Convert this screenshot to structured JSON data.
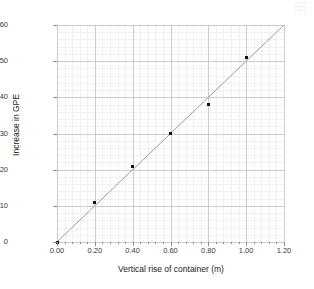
{
  "chart_data": {
    "type": "scatter",
    "title": "",
    "xlabel": "Vertical rise of container (m)",
    "ylabel": "Increase in GPE",
    "xlim": [
      0.0,
      1.2
    ],
    "ylim": [
      0,
      60
    ],
    "grid": true,
    "legend": "none",
    "x_ticks": [
      "0.00",
      "0.20",
      "0.40",
      "0.60",
      "0.80",
      "1.00",
      "1.20"
    ],
    "x_tick_values": [
      0.0,
      0.2,
      0.4,
      0.6,
      0.8,
      1.0,
      1.2
    ],
    "y_ticks": [
      "0",
      "10",
      "20",
      "30",
      "40",
      "50",
      "60"
    ],
    "y_tick_values": [
      0,
      10,
      20,
      30,
      40,
      50,
      60
    ],
    "x": [
      0.0,
      0.2,
      0.4,
      0.6,
      0.8,
      1.0
    ],
    "y": [
      0,
      11,
      21,
      30,
      38,
      51
    ],
    "points": [
      {
        "x": 0.0,
        "y": 0
      },
      {
        "x": 0.2,
        "y": 11
      },
      {
        "x": 0.4,
        "y": 21
      },
      {
        "x": 0.6,
        "y": 30
      },
      {
        "x": 0.8,
        "y": 38
      },
      {
        "x": 1.0,
        "y": 51
      }
    ],
    "series": [
      {
        "name": "Increase in GPE",
        "marker": "square",
        "marker_color": "#111111",
        "values": [
          0,
          11,
          21,
          30,
          38,
          51
        ]
      }
    ],
    "trendline": {
      "type": "line-of-best-fit",
      "color": "#9a9a9a",
      "from": {
        "x": 0.0,
        "y": 0
      },
      "to": {
        "x": 1.2,
        "y": 60
      }
    }
  },
  "colors": {
    "axis": "#8c8c8c",
    "grid_major": "#c9ccd3",
    "grid_minor": "#eef0f4",
    "marker": "#111111",
    "trendline": "#9a9a9a",
    "text": "#1a1a1a",
    "background": "#ffffff"
  }
}
